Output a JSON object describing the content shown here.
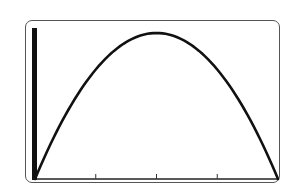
{
  "chart_data": {
    "type": "line",
    "title": "",
    "xlabel": "",
    "ylabel": "",
    "series": [
      {
        "name": "parabola",
        "x": [
          0,
          0.5,
          1,
          1.5,
          2,
          2.5,
          3,
          3.5,
          4
        ],
        "values": [
          0,
          0.4375,
          0.75,
          0.9375,
          1,
          0.9375,
          0.75,
          0.4375,
          0
        ]
      }
    ],
    "xlim": [
      0,
      4
    ],
    "ylim": [
      0,
      1.1
    ],
    "x_ticks": [
      1,
      2,
      3
    ],
    "x_tick_labels": [],
    "y_axis": "thick vertical bar at x=0",
    "grid": false,
    "legend": null,
    "colors": {
      "curve": "#111111",
      "axis": "#222222",
      "frame": "#555555"
    }
  }
}
